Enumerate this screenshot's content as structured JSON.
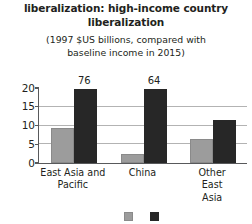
{
  "chart_data": {
    "type": "bar",
    "title": "liberalization: high-income country liberalization",
    "title_line1": "liberalization: high-income country",
    "title_line2": "liberalization",
    "subtitle": "(1997 $US billions, compared with baseline income in 2015)",
    "subtitle_line1": "(1997 $US billions, compared with",
    "subtitle_line2": "baseline income in 2015)",
    "xlabel": "",
    "ylabel": "",
    "ylim": [
      0,
      20
    ],
    "yticks": [
      0,
      5,
      10,
      15,
      20
    ],
    "ytick_labels": [
      "0",
      "5",
      "10",
      "15",
      "20"
    ],
    "grid": true,
    "legend_position": "bottom",
    "categories": [
      "East Asia and Pacific",
      "China",
      "Other East Asia"
    ],
    "category_lines": [
      [
        "East Asia and",
        "Pacific"
      ],
      [
        "China",
        ""
      ],
      [
        "Other East Asia",
        ""
      ]
    ],
    "series": [
      {
        "name": "series-1",
        "color": "#9c9c9c",
        "values": [
          9.3,
          2.5,
          6.5
        ],
        "clipped": [
          false,
          false,
          false
        ],
        "data_labels": [
          "",
          "",
          ""
        ]
      },
      {
        "name": "series-2",
        "color": "#272727",
        "values": [
          76,
          64,
          11.5
        ],
        "clipped": [
          true,
          true,
          false
        ],
        "data_labels": [
          "76",
          "64",
          ""
        ]
      }
    ],
    "annotations": [
      "76",
      "64"
    ]
  },
  "legend": {
    "items": [
      {
        "swatch": "gray",
        "label": ""
      },
      {
        "swatch": "dark",
        "label": ""
      }
    ]
  },
  "colors": {
    "series_gray": "#9c9c9c",
    "series_dark": "#272727",
    "gridline": "#b3b3b3",
    "axis": "#58595b",
    "text": "#231f20",
    "background": "#ffffff"
  }
}
